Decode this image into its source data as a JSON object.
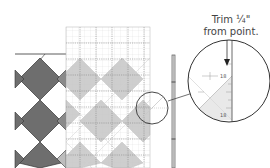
{
  "diagram": {
    "callout_text_line1": "Trim ¼\"",
    "callout_text_line2": "from point.",
    "ruler_marks": {
      "upper": "18",
      "lower": "18"
    },
    "colors": {
      "dark_diamond": "#6e6e6e",
      "light_diamond": "#c9c9c9",
      "grid_line": "#888888",
      "outline": "#333333",
      "background": "#ffffff"
    },
    "elements": [
      "dark-diamond-quilt-row",
      "ruler-grid-with-light-diamonds",
      "vertical-ruler-strip",
      "small-detail-circle",
      "magnified-detail-circle",
      "down-arrow",
      "trim-label"
    ]
  }
}
